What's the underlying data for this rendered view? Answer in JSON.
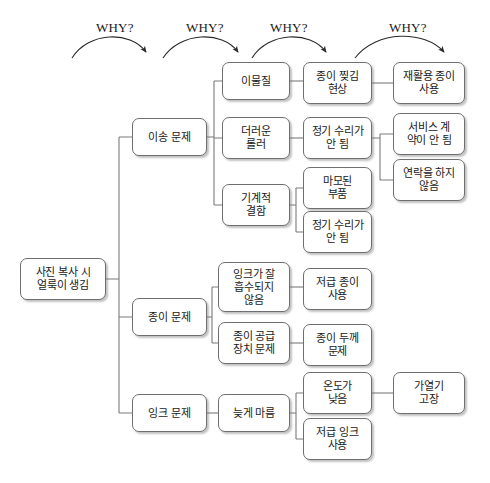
{
  "diagram": {
    "type": "why-why-tree",
    "title": "",
    "why_labels": [
      {
        "text": "WHY?",
        "x": 96,
        "y": 20
      },
      {
        "text": "WHY?",
        "x": 186,
        "y": 20
      },
      {
        "text": "WHY?",
        "x": 270,
        "y": 20
      },
      {
        "text": "WHY?",
        "x": 389,
        "y": 20
      }
    ],
    "arrows": [
      {
        "name": "why-arrow-1",
        "d": "M 72,58 C 88,32 130,30 146,52"
      },
      {
        "name": "why-arrow-2",
        "d": "M 163,58 C 180,32 222,30 238,52"
      },
      {
        "name": "why-arrow-3",
        "d": "M 252,58 C 268,32 310,30 326,52"
      },
      {
        "name": "why-arrow-4",
        "d": "M 355,58 C 376,30 425,30 444,52"
      }
    ],
    "nodes": [
      {
        "id": "root",
        "name": "node-root",
        "label": "사진 복사 시\n얼룩이 생김",
        "x": 20,
        "y": 258,
        "w": 86,
        "h": 42,
        "level": 1
      },
      {
        "id": "transport",
        "name": "node-transport-problem",
        "label": "이송 문제",
        "x": 132,
        "y": 118,
        "w": 75,
        "h": 38,
        "level": 2
      },
      {
        "id": "paper",
        "name": "node-paper-problem",
        "label": "종이 문제",
        "x": 132,
        "y": 298,
        "w": 75,
        "h": 38,
        "level": 2
      },
      {
        "id": "ink",
        "name": "node-ink-problem",
        "label": "잉크 문제",
        "x": 132,
        "y": 394,
        "w": 75,
        "h": 38,
        "level": 2
      },
      {
        "id": "foreign",
        "name": "node-foreign-matter",
        "label": "이물질",
        "x": 222,
        "y": 62,
        "w": 68,
        "h": 38,
        "level": 3
      },
      {
        "id": "dirty-roller",
        "name": "node-dirty-roller",
        "label": "더러운\n롤러",
        "x": 222,
        "y": 117,
        "w": 68,
        "h": 42,
        "level": 3
      },
      {
        "id": "mech-defect",
        "name": "node-mechanical-defect",
        "label": "기계적\n결함",
        "x": 222,
        "y": 184,
        "w": 68,
        "h": 42,
        "level": 3
      },
      {
        "id": "ink-absorb",
        "name": "node-ink-not-absorbed",
        "label": "잉크가 잘\n흡수되지\n않음",
        "x": 218,
        "y": 262,
        "w": 72,
        "h": 50,
        "level": 3
      },
      {
        "id": "paper-feed",
        "name": "node-paper-feeder-problem",
        "label": "종이 공급\n장치 문제",
        "x": 218,
        "y": 322,
        "w": 72,
        "h": 42,
        "level": 3
      },
      {
        "id": "late-dry",
        "name": "node-late-drying",
        "label": "늦게 마름",
        "x": 218,
        "y": 394,
        "w": 72,
        "h": 38,
        "level": 3
      },
      {
        "id": "paper-tear",
        "name": "node-paper-tearing",
        "label": "종이 찢김\n현상",
        "x": 303,
        "y": 62,
        "w": 69,
        "h": 42,
        "level": 4
      },
      {
        "id": "no-maint-1",
        "name": "node-no-regular-repair-1",
        "label": "정기 수리가\n안 됨",
        "x": 303,
        "y": 117,
        "w": 69,
        "h": 42,
        "level": 4
      },
      {
        "id": "worn-parts",
        "name": "node-worn-parts",
        "label": "마모된\n부품",
        "x": 303,
        "y": 167,
        "w": 69,
        "h": 42,
        "level": 4
      },
      {
        "id": "no-maint-2",
        "name": "node-no-regular-repair-2",
        "label": "정기 수리가\n안 됨",
        "x": 303,
        "y": 211,
        "w": 69,
        "h": 42,
        "level": 4
      },
      {
        "id": "low-paper-1",
        "name": "node-low-grade-paper-use",
        "label": "저급 종이\n사용",
        "x": 303,
        "y": 268,
        "w": 69,
        "h": 42,
        "level": 4
      },
      {
        "id": "paper-thick",
        "name": "node-paper-thickness-problem",
        "label": "종이 두께\n문제",
        "x": 303,
        "y": 324,
        "w": 69,
        "h": 42,
        "level": 4
      },
      {
        "id": "low-temp",
        "name": "node-low-temperature",
        "label": "온도가\n낮음",
        "x": 303,
        "y": 372,
        "w": 69,
        "h": 42,
        "level": 4
      },
      {
        "id": "low-ink",
        "name": "node-low-grade-ink-use",
        "label": "저급 잉크\n사용",
        "x": 303,
        "y": 418,
        "w": 69,
        "h": 42,
        "level": 4
      },
      {
        "id": "recycled-paper",
        "name": "node-recycled-paper-use",
        "label": "재활용 종이\n사용",
        "x": 393,
        "y": 62,
        "w": 72,
        "h": 42,
        "level": 5
      },
      {
        "id": "no-contract",
        "name": "node-no-service-contract",
        "label": "서비스 계\n약이 안 됨",
        "x": 393,
        "y": 113,
        "w": 72,
        "h": 42,
        "level": 5
      },
      {
        "id": "no-contact",
        "name": "node-no-contact-made",
        "label": "연락을 하지\n않음",
        "x": 393,
        "y": 159,
        "w": 72,
        "h": 42,
        "level": 5
      },
      {
        "id": "heater-fail",
        "name": "node-heater-failure",
        "label": "가열기\n고장",
        "x": 393,
        "y": 372,
        "w": 72,
        "h": 42,
        "level": 5
      }
    ],
    "connectors": [
      {
        "name": "connector-root-to-level2",
        "d": "M 106,279 H 119 M 119,137 V 413 M 119,137 H 132 M 119,317 H 132 M 119,413 H 132"
      },
      {
        "name": "connector-transport-children",
        "d": "M 207,137 H 214 M 214,81 V 205 M 214,81 H 222 M 214,138 H 222 M 214,205 H 222"
      },
      {
        "name": "connector-foreign-to-tear",
        "d": "M 290,81 H 303"
      },
      {
        "name": "connector-tear-to-recycled",
        "d": "M 372,83 H 393"
      },
      {
        "name": "connector-roller-to-maint",
        "d": "M 290,138 H 303"
      },
      {
        "name": "connector-maint-children",
        "d": "M 372,138 H 380 M 380,134 V 180 M 380,134 H 393 M 380,180 H 393"
      },
      {
        "name": "connector-mech-children",
        "d": "M 290,205 H 296 M 296,188 V 232 M 296,188 H 303 M 296,232 H 303"
      },
      {
        "name": "connector-paper-children",
        "d": "M 207,317 H 212 M 212,287 V 343 M 212,287 H 218 M 212,343 H 218"
      },
      {
        "name": "connector-absorb-to-lowpaper",
        "d": "M 290,287 H 303"
      },
      {
        "name": "connector-feed-to-thickness",
        "d": "M 290,343 H 303"
      },
      {
        "name": "connector-ink-to-latedry",
        "d": "M 207,413 H 218"
      },
      {
        "name": "connector-latedry-children",
        "d": "M 290,413 H 296 M 296,393 V 439 M 296,393 H 303 M 296,439 H 303"
      },
      {
        "name": "connector-lowtemp-to-heater",
        "d": "M 372,393 H 393"
      }
    ],
    "style": {
      "node_border": "#6f6f6f",
      "node_fill": "#ffffff",
      "node_shadow": "rgba(120,120,120,0.45)",
      "line_color": "#7a7a7a",
      "text_color": "#1a1a1a",
      "background": "#ffffff"
    }
  }
}
